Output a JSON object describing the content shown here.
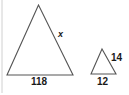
{
  "figure": {
    "large_triangle": {
      "base_label": "118",
      "side_label": "x",
      "points": [
        [
          38.5,
          5
        ],
        [
          7,
          75
        ],
        [
          73,
          75
        ]
      ]
    },
    "small_triangle": {
      "base_label": "12",
      "side_label": "14",
      "points": [
        [
          102,
          49
        ],
        [
          91,
          74
        ],
        [
          116,
          74
        ]
      ]
    },
    "stroke_color": "#555555",
    "border_color": "#d0d0d0"
  }
}
